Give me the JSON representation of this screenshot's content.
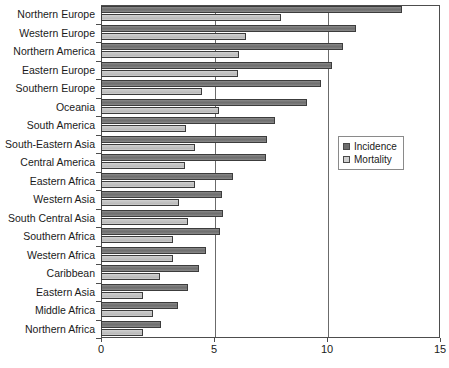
{
  "chart_data": {
    "type": "bar",
    "orientation": "horizontal",
    "title": "",
    "xlabel": "",
    "ylabel": "",
    "xlim": [
      0,
      15
    ],
    "xticks": [
      0,
      5,
      10,
      15
    ],
    "xtick_labels": [
      "0",
      "5",
      "10",
      "15"
    ],
    "grid": true,
    "grid_axis": "x",
    "legend_position": "right",
    "categories": [
      "Northern Europe",
      "Western Europe",
      "Northern America",
      "Eastern Europe",
      "Southern Europe",
      "Oceania",
      "South America",
      "South-Eastern Asia",
      "Central America",
      "Eastern Africa",
      "Western Asia",
      "South Central Asia",
      "Southern Africa",
      "Western Africa",
      "Caribbean",
      "Eastern Asia",
      "Middle Africa",
      "Northern Africa"
    ],
    "series": [
      {
        "name": "Incidence",
        "color": "#6e6e6e",
        "values": [
          13.3,
          11.3,
          10.7,
          10.2,
          9.75,
          9.1,
          7.7,
          7.35,
          7.3,
          5.85,
          5.35,
          5.4,
          5.25,
          4.65,
          4.35,
          3.85,
          3.4,
          2.65
        ]
      },
      {
        "name": "Mortality",
        "color": "#d0d0d0",
        "values": [
          7.95,
          6.4,
          6.1,
          6.05,
          4.45,
          5.2,
          3.75,
          4.15,
          3.7,
          4.15,
          3.45,
          3.85,
          3.2,
          3.2,
          2.6,
          1.85,
          2.3,
          1.85
        ]
      }
    ]
  },
  "legend": {
    "items": [
      {
        "label": "Incidence"
      },
      {
        "label": "Mortality"
      }
    ]
  },
  "colors": {
    "incidence": "#6e6e6e",
    "mortality": "#d0d0d0",
    "axis": "#4d4d4d",
    "grid": "#6b6b6b",
    "background": "#ffffff"
  }
}
